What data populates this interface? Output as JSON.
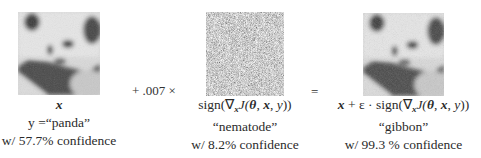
{
  "figure": {
    "panels": [
      {
        "id": "original",
        "image": "panda-photo",
        "label": "x",
        "class_line": "y =“panda”",
        "confidence_line": "w/ 57.7% confidence"
      },
      {
        "id": "perturbation",
        "image": "noise-pattern",
        "label": "sign(∇xJ(θ, x, y))",
        "class_line": "“nematode”",
        "confidence_line": "w/ 8.2% confidence"
      },
      {
        "id": "adversarial",
        "image": "panda-photo-perturbed",
        "label": "x + ε · sign(∇xJ(θ, x, y))",
        "class_line": "“gibbon”",
        "confidence_line": "w/ 99.3 % confidence"
      }
    ],
    "operators": {
      "plus_scale": "+ .007 ×",
      "equals": "="
    },
    "labels_rich": {
      "x": "x",
      "y_eq": "y =",
      "panda": "“panda”",
      "sign_open": "sign(∇",
      "sub_x": "x",
      "J_open": "J(",
      "theta": "θ",
      "comma1": ", ",
      "x_bold": "x",
      "comma2": ", ",
      "y": "y",
      "close": "))",
      "plus_eps": " + ε · "
    }
  }
}
